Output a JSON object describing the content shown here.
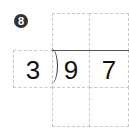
{
  "problem": {
    "number": "8",
    "divisor": "3",
    "dividend_digits": [
      "9",
      "7"
    ],
    "quotient_digits": [
      "",
      ""
    ],
    "work_rows": [
      [
        "",
        ""
      ]
    ]
  }
}
